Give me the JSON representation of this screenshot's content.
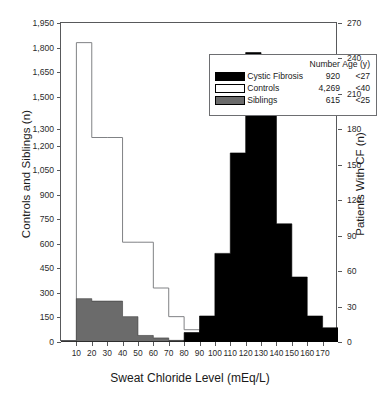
{
  "chart_data": {
    "type": "bar",
    "title": "",
    "xlabel": "Sweat Chloride Level (mEq/L)",
    "ylabel": "Controls and Siblings (n)",
    "ylabel_right": "Patients With CF (n)",
    "xlim": [
      0,
      180
    ],
    "bin_width": 10,
    "ylim": [
      0,
      1950
    ],
    "ylim_right": [
      0,
      270
    ],
    "grid": false,
    "legend_position": "top-center",
    "xticks": [
      10,
      20,
      30,
      40,
      50,
      60,
      70,
      80,
      90,
      100,
      110,
      120,
      130,
      140,
      150,
      160,
      170
    ],
    "yticks_left": [
      0,
      150,
      300,
      450,
      600,
      750,
      900,
      1050,
      1200,
      1300,
      1500,
      1650,
      1800,
      1950
    ],
    "ytick_labels_left": [
      "0",
      "150",
      "300",
      "450",
      "600",
      "750",
      "900",
      "1,050",
      "1,200",
      "1,300",
      "1,500",
      "1,650",
      "1,800",
      "1,950"
    ],
    "yticks_right": [
      0,
      30,
      60,
      90,
      120,
      150,
      180,
      210,
      240,
      270
    ],
    "ytick_labels_right": [
      "0",
      "30",
      "60",
      "90",
      "120",
      "150",
      "180",
      "210",
      "240",
      "270"
    ],
    "bin_starts": [
      0,
      10,
      20,
      30,
      40,
      50,
      60,
      70,
      80,
      90,
      100,
      110,
      120,
      130,
      140,
      150,
      160,
      170
    ],
    "series": [
      {
        "name": "Controls",
        "style": "outline",
        "axis": "left",
        "color": "#ffffff",
        "edge_color": "#808285",
        "total": "4,269",
        "age": "<40",
        "values": [
          0,
          1830,
          1250,
          1250,
          610,
          610,
          330,
          155,
          75,
          25,
          0,
          0,
          0,
          0,
          0,
          0,
          0,
          0
        ]
      },
      {
        "name": "Siblings",
        "style": "filled",
        "axis": "left",
        "color": "#6b6b6b",
        "edge_color": "#3a3a3a",
        "total": "615",
        "age": "<25",
        "values": [
          0,
          265,
          250,
          250,
          155,
          40,
          25,
          10,
          5,
          0,
          0,
          0,
          0,
          0,
          0,
          0,
          0,
          0
        ]
      },
      {
        "name": "Cystic Fibrosis",
        "style": "filled",
        "axis": "right",
        "color": "#000000",
        "edge_color": "#000000",
        "total": "920",
        "age": "<27",
        "values": [
          0,
          0,
          0,
          0,
          0,
          0,
          0,
          0,
          8,
          22,
          75,
          160,
          245,
          205,
          100,
          55,
          22,
          12
        ]
      }
    ]
  },
  "legend": {
    "header_number": "Number",
    "header_age": "Age (y)",
    "rows": [
      {
        "label": "Cystic Fibrosis",
        "number": "920",
        "age": "<27",
        "swatch": "cf"
      },
      {
        "label": "Controls",
        "number": "4,269",
        "age": "<40",
        "swatch": "ctl"
      },
      {
        "label": "Siblings",
        "number": "615",
        "age": "<25",
        "swatch": "sib"
      }
    ]
  }
}
